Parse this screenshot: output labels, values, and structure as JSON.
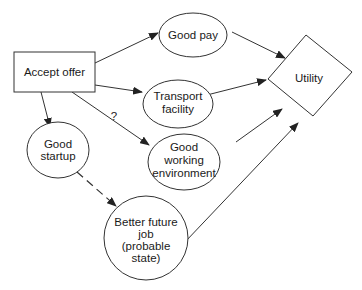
{
  "diagram": {
    "type": "influence-diagram",
    "nodes": [
      {
        "id": "accept_offer",
        "shape": "rectangle",
        "label_lines": [
          "Accept offer"
        ]
      },
      {
        "id": "good_pay",
        "shape": "ellipse",
        "label_lines": [
          "Good pay"
        ]
      },
      {
        "id": "transport_facility",
        "shape": "ellipse",
        "label_lines": [
          "Transport",
          "facility"
        ]
      },
      {
        "id": "good_working_environment",
        "shape": "ellipse",
        "label_lines": [
          "Good",
          "working",
          "environment"
        ]
      },
      {
        "id": "good_startup",
        "shape": "ellipse",
        "label_lines": [
          "Good",
          "startup"
        ]
      },
      {
        "id": "better_future_job",
        "shape": "circle",
        "label_lines": [
          "Better future",
          "job",
          "(probable",
          "state)"
        ]
      },
      {
        "id": "utility",
        "shape": "diamond",
        "label_lines": [
          "Utility"
        ]
      }
    ],
    "edges": [
      {
        "from": "accept_offer",
        "to": "good_pay",
        "style": "solid"
      },
      {
        "from": "accept_offer",
        "to": "transport_facility",
        "style": "solid"
      },
      {
        "from": "accept_offer",
        "to": "good_working_environment",
        "style": "solid",
        "label": "?"
      },
      {
        "from": "accept_offer",
        "to": "good_startup",
        "style": "solid"
      },
      {
        "from": "good_startup",
        "to": "better_future_job",
        "style": "dashed"
      },
      {
        "from": "good_pay",
        "to": "utility",
        "style": "solid"
      },
      {
        "from": "transport_facility",
        "to": "utility",
        "style": "solid"
      },
      {
        "from": "good_working_environment",
        "to": "utility",
        "style": "solid"
      },
      {
        "from": "better_future_job",
        "to": "utility",
        "style": "solid"
      }
    ],
    "edge_label_question": "?",
    "colors": {
      "stroke": "#333333",
      "fill": "#ffffff",
      "text": "#1a1a1a"
    }
  }
}
